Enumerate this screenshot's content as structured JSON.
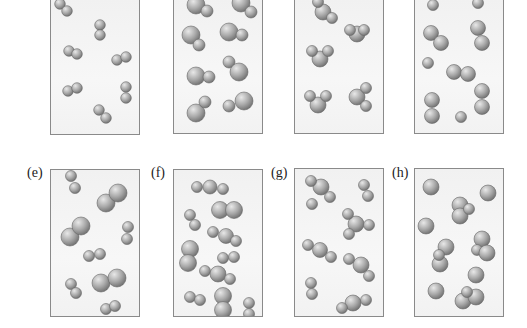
{
  "figure": {
    "panels": [
      {
        "id": "a",
        "label": "",
        "content": "eight diatomic molecules of identical atoms"
      },
      {
        "id": "b",
        "label": "",
        "content": "eight diatomic molecules of one large and one small atom"
      },
      {
        "id": "c",
        "label": "",
        "content": "triatomic bent molecules (one large, two small atoms)"
      },
      {
        "id": "d",
        "label": "",
        "content": "mixture of monatomic atoms and diatomic molecules"
      },
      {
        "id": "e",
        "label": "(e)",
        "content": "mixture of small diatomic and large diatomic molecules"
      },
      {
        "id": "f",
        "label": "(f)",
        "content": "mixture of triatomic, large diatomic and small diatomic molecules"
      },
      {
        "id": "g",
        "label": "(g)",
        "content": "mixture of tetra-atomic, triatomic and diatomic molecules"
      },
      {
        "id": "h",
        "label": "(h)",
        "content": "mixture of single atoms and triatomic molecules"
      }
    ]
  },
  "colors": {
    "sphere_light": "#e8e8e8",
    "sphere_mid": "#a9a9a9",
    "sphere_dark": "#6e6e6e",
    "border": "#8a8a8a"
  }
}
